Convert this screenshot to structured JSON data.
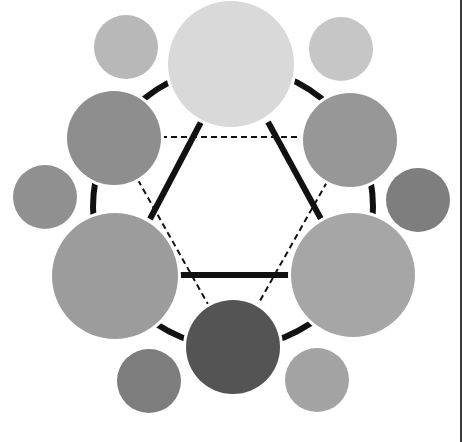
{
  "diagram": {
    "type": "color-wheel",
    "rendering": "grayscale",
    "ring": {
      "cx": 233,
      "cy": 207,
      "r": 140,
      "stroke": "#111111",
      "width": 6
    },
    "solid_triangle": {
      "connects": [
        "top-large",
        "lower-left-large",
        "lower-right-large"
      ],
      "stroke": "#111111",
      "width": 6,
      "segments": [
        {
          "x1": 201,
          "y1": 122,
          "x2": 150,
          "y2": 219
        },
        {
          "x1": 268,
          "y1": 122,
          "x2": 321,
          "y2": 219
        },
        {
          "x1": 180,
          "y1": 275,
          "x2": 290,
          "y2": 275
        }
      ]
    },
    "dashed_triangle": {
      "connects": [
        "upper-left-medium",
        "upper-right-medium",
        "bottom-medium"
      ],
      "stroke": "#111111",
      "width": 2,
      "dash": "6 4",
      "segments": [
        {
          "x1": 161,
          "y1": 137,
          "x2": 304,
          "y2": 137
        },
        {
          "x1": 138,
          "y1": 180,
          "x2": 209,
          "y2": 306
        },
        {
          "x1": 327,
          "y1": 182,
          "x2": 257,
          "y2": 306
        }
      ]
    },
    "circles": [
      {
        "id": "top-large",
        "size": "large",
        "cx": 231,
        "cy": 64,
        "r": 63,
        "fill": "#d9d9d9"
      },
      {
        "id": "lower-left-large",
        "size": "large",
        "cx": 115,
        "cy": 276,
        "r": 63,
        "fill": "#9c9c9c"
      },
      {
        "id": "lower-right-large",
        "size": "large",
        "cx": 353,
        "cy": 275,
        "r": 62,
        "fill": "#a6a6a6"
      },
      {
        "id": "upper-left-medium",
        "size": "medium",
        "cx": 114,
        "cy": 138,
        "r": 47,
        "fill": "#8e8e8e"
      },
      {
        "id": "upper-right-medium",
        "size": "medium",
        "cx": 350,
        "cy": 140,
        "r": 47,
        "fill": "#979797"
      },
      {
        "id": "bottom-medium",
        "size": "medium",
        "cx": 233,
        "cy": 347,
        "r": 47,
        "fill": "#545454"
      },
      {
        "id": "top-left-small",
        "size": "small",
        "cx": 126,
        "cy": 47,
        "r": 32,
        "fill": "#b8b8b8"
      },
      {
        "id": "top-right-small",
        "size": "small",
        "cx": 341,
        "cy": 49,
        "r": 32,
        "fill": "#c6c6c6"
      },
      {
        "id": "left-small",
        "size": "small",
        "cx": 45,
        "cy": 197,
        "r": 32,
        "fill": "#909090"
      },
      {
        "id": "right-small",
        "size": "small",
        "cx": 418,
        "cy": 200,
        "r": 32,
        "fill": "#7e7e7e"
      },
      {
        "id": "bottom-left-small",
        "size": "small",
        "cx": 149,
        "cy": 381,
        "r": 32,
        "fill": "#7d7d7d"
      },
      {
        "id": "bottom-right-small",
        "size": "small",
        "cx": 317,
        "cy": 380,
        "r": 32,
        "fill": "#a3a3a3"
      }
    ]
  }
}
